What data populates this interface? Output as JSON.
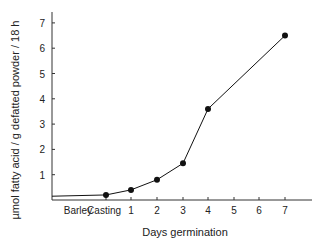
{
  "chart_data": {
    "type": "line",
    "title": "",
    "xlabel": "Days germination",
    "ylabel": "µmol fatty acid / g defatted powder / 18 h",
    "x_tick_labels": [
      "Barley",
      "Casting",
      "1",
      "2",
      "3",
      "4",
      "5",
      "6",
      "7"
    ],
    "y_ticks": [
      1,
      2,
      3,
      4,
      5,
      6,
      7
    ],
    "ylim": [
      0,
      7.5
    ],
    "grid": false,
    "legend": null,
    "series": [
      {
        "name": "fatty acid release",
        "color": "#111111",
        "points": [
          {
            "x": "Casting",
            "y": 0.2
          },
          {
            "x": "1",
            "y": 0.4
          },
          {
            "x": "2",
            "y": 0.8
          },
          {
            "x": "3",
            "y": 1.45
          },
          {
            "x": "4",
            "y": 3.6
          },
          {
            "x": "7",
            "y": 6.5
          }
        ]
      }
    ],
    "baseline": {
      "label": "Barley",
      "y": 0.15
    }
  }
}
